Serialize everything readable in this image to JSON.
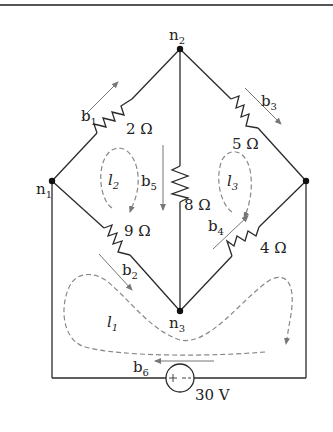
{
  "diagram": {
    "type": "circuit",
    "nodes": [
      {
        "id": "n1",
        "label": "n",
        "sub": "1"
      },
      {
        "id": "n2",
        "label": "n",
        "sub": "2"
      },
      {
        "id": "n3",
        "label": "n",
        "sub": "3"
      }
    ],
    "resistors": [
      {
        "id": "r_2",
        "label": "2 Ω"
      },
      {
        "id": "r_5",
        "label": "5 Ω"
      },
      {
        "id": "r_8",
        "label": "8 Ω"
      },
      {
        "id": "r_9",
        "label": "9 Ω"
      },
      {
        "id": "r_4",
        "label": "4 Ω"
      }
    ],
    "source": {
      "label": "30 V",
      "polarity": "+ −"
    },
    "branches": [
      {
        "label": "b",
        "sub": "1"
      },
      {
        "label": "b",
        "sub": "2"
      },
      {
        "label": "b",
        "sub": "3"
      },
      {
        "label": "b",
        "sub": "4"
      },
      {
        "label": "b",
        "sub": "5"
      },
      {
        "label": "b",
        "sub": "6"
      }
    ],
    "loops": [
      {
        "label": "l",
        "sub": "1"
      },
      {
        "label": "l",
        "sub": "2"
      },
      {
        "label": "l",
        "sub": "3"
      }
    ]
  }
}
